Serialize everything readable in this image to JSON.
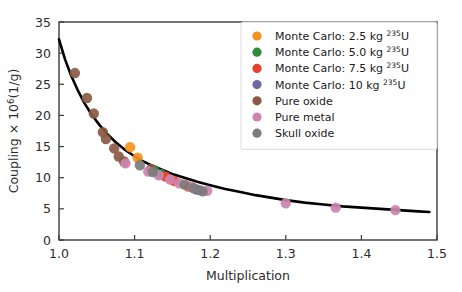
{
  "chart_data": {
    "type": "scatter",
    "title": "",
    "xlabel": "Multiplication",
    "ylabel": "Coupling × 10⁶(1/g)",
    "xlim": [
      1.0,
      1.5
    ],
    "ylim": [
      0,
      35
    ],
    "xticks": [
      "1.0",
      "1.1",
      "1.2",
      "1.3",
      "1.4",
      "1.5"
    ],
    "xtick_values": [
      1.0,
      1.1,
      1.2,
      1.3,
      1.4,
      1.5
    ],
    "yticks": [
      "0",
      "5",
      "10",
      "15",
      "20",
      "25",
      "30",
      "35"
    ],
    "ytick_values": [
      0,
      5,
      10,
      15,
      20,
      25,
      30,
      35
    ],
    "grid": false,
    "legend_position": "upper right",
    "series": [
      {
        "name": "Monte Carlo: 2.5 kg ²³⁵U",
        "key": "mc25",
        "color": "#f5921e",
        "points": [
          [
            1.094,
            14.9
          ],
          [
            1.104,
            13.2
          ]
        ]
      },
      {
        "name": "Monte Carlo: 5.0 kg ²³⁵U",
        "key": "mc50",
        "color": "#2e8b3c",
        "points": [
          [
            1.126,
            11.2
          ],
          [
            1.135,
            10.6
          ]
        ]
      },
      {
        "name": "Monte Carlo: 7.5 kg ²³⁵U",
        "key": "mc75",
        "color": "#e8402a",
        "points": [
          [
            1.141,
            10.2
          ],
          [
            1.152,
            9.5
          ],
          [
            1.171,
            8.6
          ]
        ]
      },
      {
        "name": "Monte Carlo: 10 kg ²³⁵U",
        "key": "mc10",
        "color": "#6d6a9e",
        "points": [
          [
            1.182,
            8.1
          ]
        ]
      },
      {
        "name": "Pure oxide",
        "key": "pure_oxide",
        "color": "#8a5a44",
        "points": [
          [
            1.021,
            26.8
          ],
          [
            1.037,
            22.8
          ],
          [
            1.046,
            20.3
          ],
          [
            1.058,
            17.3
          ],
          [
            1.062,
            16.2
          ],
          [
            1.073,
            14.7
          ],
          [
            1.079,
            13.4
          ],
          [
            1.086,
            12.6
          ],
          [
            1.122,
            11.4
          ]
        ]
      },
      {
        "name": "Pure metal",
        "key": "pure_metal",
        "color": "#cc84ad",
        "points": [
          [
            1.088,
            12.3
          ],
          [
            1.118,
            11.0
          ],
          [
            1.132,
            10.4
          ],
          [
            1.147,
            9.7
          ],
          [
            1.159,
            9.1
          ],
          [
            1.176,
            8.5
          ],
          [
            1.196,
            7.9
          ],
          [
            1.3,
            5.9
          ],
          [
            1.366,
            5.2
          ],
          [
            1.445,
            4.8
          ]
        ]
      },
      {
        "name": "Skull oxide",
        "key": "skull_oxide",
        "color": "#7c7c7c",
        "points": [
          [
            1.107,
            12.0
          ],
          [
            1.124,
            10.9
          ],
          [
            1.166,
            8.9
          ],
          [
            1.178,
            8.3
          ],
          [
            1.186,
            8.0
          ],
          [
            1.19,
            7.8
          ]
        ]
      }
    ],
    "fit_curve": {
      "name": "fit",
      "color": "#000000",
      "points": [
        [
          1.0,
          32.2
        ],
        [
          1.008,
          29.0
        ],
        [
          1.016,
          26.4
        ],
        [
          1.025,
          24.0
        ],
        [
          1.034,
          21.9
        ],
        [
          1.044,
          20.0
        ],
        [
          1.054,
          18.4
        ],
        [
          1.064,
          17.0
        ],
        [
          1.075,
          15.7
        ],
        [
          1.086,
          14.6
        ],
        [
          1.098,
          13.6
        ],
        [
          1.11,
          12.7
        ],
        [
          1.124,
          11.9
        ],
        [
          1.138,
          11.2
        ],
        [
          1.152,
          10.5
        ],
        [
          1.168,
          9.9
        ],
        [
          1.184,
          9.3
        ],
        [
          1.2,
          8.8
        ],
        [
          1.22,
          8.2
        ],
        [
          1.24,
          7.7
        ],
        [
          1.26,
          7.2
        ],
        [
          1.28,
          6.8
        ],
        [
          1.3,
          6.4
        ],
        [
          1.325,
          6.0
        ],
        [
          1.35,
          5.7
        ],
        [
          1.375,
          5.4
        ],
        [
          1.4,
          5.2
        ],
        [
          1.425,
          5.0
        ],
        [
          1.45,
          4.8
        ],
        [
          1.475,
          4.6
        ],
        [
          1.49,
          4.5
        ]
      ]
    }
  }
}
